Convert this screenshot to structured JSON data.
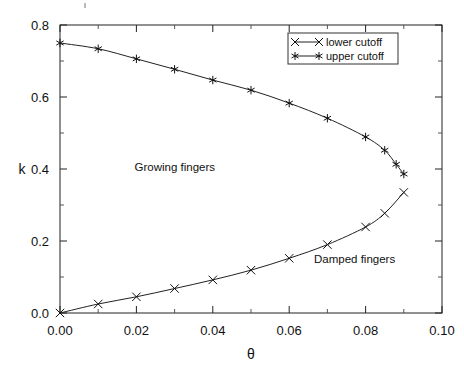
{
  "chart_data": {
    "type": "line",
    "title": "",
    "xlabel": "θ",
    "ylabel": "k",
    "xlim": [
      0.0,
      0.1
    ],
    "ylim": [
      0.0,
      0.8
    ],
    "grid": false,
    "legend_position": "top-right",
    "xticks": [
      "0.00",
      "0.02",
      "0.04",
      "0.06",
      "0.08",
      "0.10"
    ],
    "xtick_values": [
      0.0,
      0.02,
      0.04,
      0.06,
      0.08,
      0.1
    ],
    "xminor_values": [
      0.01,
      0.03,
      0.05,
      0.07,
      0.09
    ],
    "yticks": [
      "0.0",
      "0.2",
      "0.4",
      "0.6",
      "0.8"
    ],
    "ytick_values": [
      0.0,
      0.2,
      0.4,
      0.6,
      0.8
    ],
    "yminor_values": [
      0.1,
      0.3,
      0.5,
      0.7
    ],
    "series": [
      {
        "name": "lower cutoff",
        "marker": "x",
        "x": [
          0.0,
          0.01,
          0.02,
          0.03,
          0.04,
          0.05,
          0.06,
          0.07,
          0.08,
          0.085,
          0.09
        ],
        "y": [
          0.0,
          0.025,
          0.045,
          0.068,
          0.092,
          0.119,
          0.152,
          0.19,
          0.239,
          0.277,
          0.335
        ]
      },
      {
        "name": "upper cutoff",
        "marker": "asterisk",
        "x": [
          0.0,
          0.01,
          0.02,
          0.03,
          0.04,
          0.05,
          0.06,
          0.07,
          0.08,
          0.085,
          0.088,
          0.09
        ],
        "y": [
          0.75,
          0.734,
          0.706,
          0.677,
          0.647,
          0.619,
          0.583,
          0.541,
          0.489,
          0.452,
          0.413,
          0.386
        ]
      }
    ],
    "annotations": [
      {
        "text": "Growing fingers",
        "x": 0.0195,
        "y": 0.405
      },
      {
        "text": "Damped fingers",
        "x": 0.0665,
        "y": 0.151
      }
    ]
  }
}
